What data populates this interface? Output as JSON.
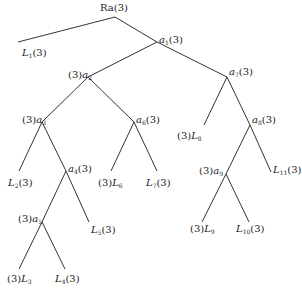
{
  "diagram": {
    "type": "tree",
    "line_color": "#333333",
    "text_color": "#1a1a1a",
    "nodes": [
      {
        "id": "Ra",
        "label": "Ra(3)",
        "x": 115,
        "y": 18,
        "parent": null
      },
      {
        "id": "L1",
        "label": "L1(3)",
        "x": 20,
        "y": 45,
        "parent": "Ra"
      },
      {
        "id": "a1",
        "label": "a1(3)",
        "x": 157,
        "y": 43,
        "parent": "Ra"
      },
      {
        "id": "a2",
        "label": "(3)a2",
        "x": 88,
        "y": 77,
        "parent": "a1"
      },
      {
        "id": "a7",
        "label": "a7(3)",
        "x": 227,
        "y": 77,
        "parent": "a1"
      },
      {
        "id": "a3",
        "label": "(3)a3",
        "x": 42,
        "y": 121,
        "parent": "a2"
      },
      {
        "id": "a6",
        "label": "a6(3)",
        "x": 135,
        "y": 121,
        "parent": "a2"
      },
      {
        "id": "L2",
        "label": "L2(3)",
        "x": 19,
        "y": 171,
        "parent": "a3"
      },
      {
        "id": "a4",
        "label": "a4(3)",
        "x": 66,
        "y": 170,
        "parent": "a3"
      },
      {
        "id": "a5",
        "label": "(3)a5",
        "x": 42,
        "y": 221,
        "parent": "a4"
      },
      {
        "id": "L5",
        "label": "L5(3)",
        "x": 88,
        "y": 221,
        "parent": "a4"
      },
      {
        "id": "L3",
        "label": "(3)L3",
        "x": 19,
        "y": 271,
        "parent": "a5"
      },
      {
        "id": "L4",
        "label": "L4(3)",
        "x": 64,
        "y": 271,
        "parent": "a5"
      },
      {
        "id": "L6",
        "label": "(3)L6",
        "x": 112,
        "y": 171,
        "parent": "a6"
      },
      {
        "id": "L7",
        "label": "L7(3)",
        "x": 157,
        "y": 171,
        "parent": "a6"
      },
      {
        "id": "L8",
        "label": "(3)L8",
        "x": 205,
        "y": 125,
        "parent": "a7"
      },
      {
        "id": "a8",
        "label": "a8(3)",
        "x": 250,
        "y": 121,
        "parent": "a7"
      },
      {
        "id": "a9",
        "label": "(3)a9",
        "x": 226,
        "y": 173,
        "parent": "a8"
      },
      {
        "id": "L11",
        "label": "L11(3)",
        "x": 272,
        "y": 171,
        "parent": "a8"
      },
      {
        "id": "L9",
        "label": "(3)L9",
        "x": 203,
        "y": 216,
        "parent": "a9"
      },
      {
        "id": "L10",
        "label": "L10(3)",
        "x": 249,
        "y": 216,
        "parent": "a9"
      }
    ],
    "labels": {
      "Ra": {
        "pre": "",
        "base": "Ra",
        "sub": "",
        "post": "(3)"
      },
      "L1": {
        "pre": "",
        "base": "L",
        "sub": "1",
        "post": "(3)"
      },
      "a1": {
        "pre": "",
        "base": "a",
        "sub": "1",
        "post": "(3)"
      },
      "a2": {
        "pre": "(3)",
        "base": "a",
        "sub": "2",
        "post": ""
      },
      "a7": {
        "pre": "",
        "base": "a",
        "sub": "7",
        "post": "(3)"
      },
      "a3": {
        "pre": "(3)",
        "base": "a",
        "sub": "3",
        "post": ""
      },
      "a6": {
        "pre": "",
        "base": "a",
        "sub": "6",
        "post": "(3)"
      },
      "L2": {
        "pre": "",
        "base": "L",
        "sub": "2",
        "post": "(3)"
      },
      "a4": {
        "pre": "",
        "base": "a",
        "sub": "4",
        "post": "(3)"
      },
      "a5": {
        "pre": "(3)",
        "base": "a",
        "sub": "5",
        "post": ""
      },
      "L5": {
        "pre": "",
        "base": "L",
        "sub": "5",
        "post": "(3)"
      },
      "L3": {
        "pre": "(3)",
        "base": "L",
        "sub": "3",
        "post": ""
      },
      "L4": {
        "pre": "",
        "base": "L",
        "sub": "4",
        "post": "(3)"
      },
      "L6": {
        "pre": "(3)",
        "base": "L",
        "sub": "6",
        "post": ""
      },
      "L7": {
        "pre": "",
        "base": "L",
        "sub": "7",
        "post": "(3)"
      },
      "L8": {
        "pre": "(3)",
        "base": "L",
        "sub": "8",
        "post": ""
      },
      "a8": {
        "pre": "",
        "base": "a",
        "sub": "8",
        "post": "(3)"
      },
      "a9": {
        "pre": "(3)",
        "base": "a",
        "sub": "9",
        "post": ""
      },
      "L11": {
        "pre": "",
        "base": "L",
        "sub": "11",
        "post": "(3)"
      },
      "L9": {
        "pre": "(3)",
        "base": "L",
        "sub": "9",
        "post": ""
      },
      "L10": {
        "pre": "",
        "base": "L",
        "sub": "10",
        "post": "(3)"
      }
    }
  }
}
